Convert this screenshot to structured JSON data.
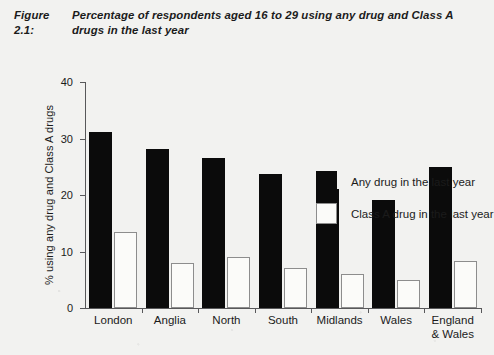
{
  "figure": {
    "number": "Figure 2.1:",
    "caption": "Percentage of respondents aged 16 to 29 using any drug and Class A drugs in the last year"
  },
  "chart_data": {
    "type": "bar",
    "title": "Percentage of respondents aged 16 to 29 using any drug and Class A drugs in the last year",
    "xlabel": "",
    "ylabel": "% using any drug and Class A drugs",
    "ylim": [
      0,
      40
    ],
    "yticks": [
      0,
      10,
      20,
      30,
      40
    ],
    "ytick_labels": [
      "0",
      "10",
      "20",
      "30",
      "40"
    ],
    "grid": false,
    "legend_position": "upper right (inside plot)",
    "categories": [
      "London",
      "Anglia",
      "North",
      "South",
      "Midlands",
      "Wales",
      "England\n& Wales"
    ],
    "series": [
      {
        "name": "Any drug in the last year",
        "color": "#0b0b0b",
        "values": [
          31.2,
          28.2,
          26.5,
          23.8,
          21.1,
          19.1,
          25.0
        ]
      },
      {
        "name": "Class A drug in the last year",
        "color": "#ffffff",
        "values": [
          13.5,
          8.0,
          9.1,
          7.0,
          6.0,
          5.0,
          8.4
        ]
      }
    ]
  }
}
